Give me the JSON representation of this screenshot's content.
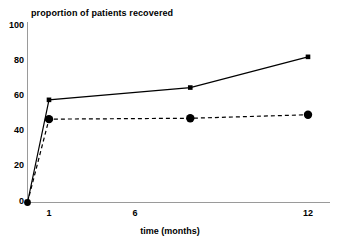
{
  "chart_data": {
    "type": "line",
    "title": "proportion of patients recovered",
    "xlabel": "time (months)",
    "ylabel": "",
    "xlim": [
      0,
      13
    ],
    "ylim": [
      0,
      100
    ],
    "grid": false,
    "legend": "none",
    "x_ticks": [
      "1",
      "6",
      "12"
    ],
    "x_tick_values": [
      1,
      6,
      12
    ],
    "y_ticks": [
      "0",
      "20",
      "40",
      "60",
      "80",
      "100"
    ],
    "y_tick_values": [
      0,
      20,
      40,
      60,
      80,
      100
    ],
    "series": [
      {
        "name": "solid-series",
        "style": "solid",
        "marker": "square",
        "color": "#000000",
        "x": [
          0,
          1,
          7,
          12
        ],
        "values": [
          0,
          58.5,
          65.5,
          83
        ]
      },
      {
        "name": "dashed-series",
        "style": "dashed",
        "marker": "circle",
        "color": "#000000",
        "x": [
          0,
          1,
          7,
          12
        ],
        "values": [
          0,
          47.5,
          48,
          50
        ]
      }
    ]
  },
  "axes": {
    "axis_color": "#9a9a9a",
    "text_color": "#000000",
    "background": "#ffffff"
  }
}
